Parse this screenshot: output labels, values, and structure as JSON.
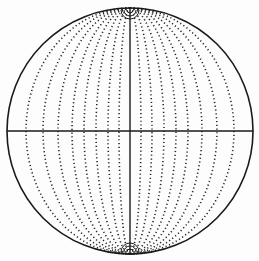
{
  "figure": {
    "title": "",
    "colors": {
      "ink": "#1a1a1a",
      "background": "#fdfdfd"
    },
    "circle": {
      "cx": 130,
      "cy": 131,
      "r": 123
    },
    "meridian_offsets": [
      11,
      22,
      34,
      46,
      58,
      72,
      87,
      104
    ],
    "polar_arc_radii": [
      3,
      6,
      9
    ]
  }
}
